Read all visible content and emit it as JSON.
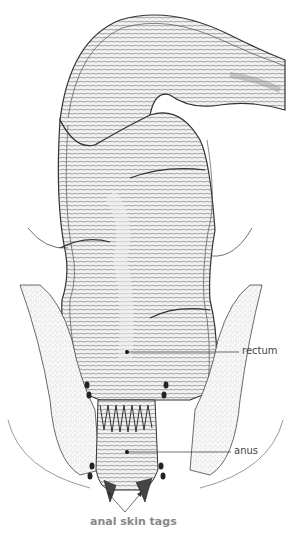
{
  "diagram": {
    "labels": {
      "rectum": "rectum",
      "anus": "anus",
      "anal_skin_tags": "anal skin tags"
    },
    "colors": {
      "line": "#333333",
      "shade": "#9a9a9a",
      "tissue": "#d9d9d9",
      "label_text": "#444444",
      "caption_text": "#888888"
    }
  }
}
